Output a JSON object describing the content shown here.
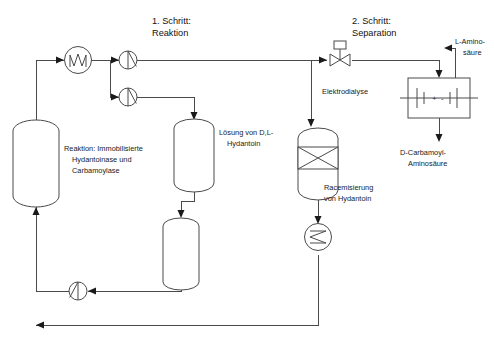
{
  "diagram": {
    "headings": [
      {
        "line1": "1. Schritt:",
        "line2": "Reaktion"
      },
      {
        "line1": "2. Schritt:",
        "line2": "Separation"
      }
    ],
    "labels": {
      "reactor": {
        "line1": "Reaktion: Immobilisierte",
        "line2": "Hydantoinase und",
        "line3": "Carbamoylase"
      },
      "solution_tank": {
        "line1": "Lösung von D,L-",
        "line2": "Hydantoin"
      },
      "racemization": {
        "line1": "Racemisierung",
        "line2": "von Hydantoin"
      },
      "electrodialysis": "Elektrodialyse",
      "product_top": {
        "line1": "L-Amino-",
        "line2": "säure"
      },
      "product_bottom": {
        "line1": "D-Carbamoyl-",
        "line2": "Aminosäure"
      }
    },
    "electrode_symbols": {
      "positive": "+",
      "negative": "-"
    },
    "colors": {
      "line": "#4a4a4a",
      "arrow": "#1a1a1a",
      "text": "#1a1a1a",
      "background": "#ffffff"
    },
    "equipment": [
      {
        "id": "heat-exchanger-feed",
        "type": "heat-exchanger",
        "shape": "circle-with-zigzag"
      },
      {
        "id": "pump-top",
        "type": "pump",
        "shape": "circle-with-diagonal"
      },
      {
        "id": "pump-middle",
        "type": "pump",
        "shape": "circle-with-diagonal"
      },
      {
        "id": "pump-recycle",
        "type": "pump",
        "shape": "circle-with-diagonal"
      },
      {
        "id": "reactor-vessel",
        "type": "vessel",
        "shape": "rounded-tank"
      },
      {
        "id": "solution-tank",
        "type": "vessel",
        "shape": "rounded-tank"
      },
      {
        "id": "holding-tank",
        "type": "vessel",
        "shape": "rounded-tank"
      },
      {
        "id": "racemization-column",
        "type": "column",
        "shape": "tank-with-packing-x"
      },
      {
        "id": "cooler",
        "type": "heat-exchanger",
        "shape": "circle-with-zigzag"
      },
      {
        "id": "control-valve",
        "type": "valve",
        "shape": "bowtie-with-actuator"
      },
      {
        "id": "electrodialysis-cell",
        "type": "separator",
        "shape": "box-with-electrodes"
      }
    ]
  }
}
